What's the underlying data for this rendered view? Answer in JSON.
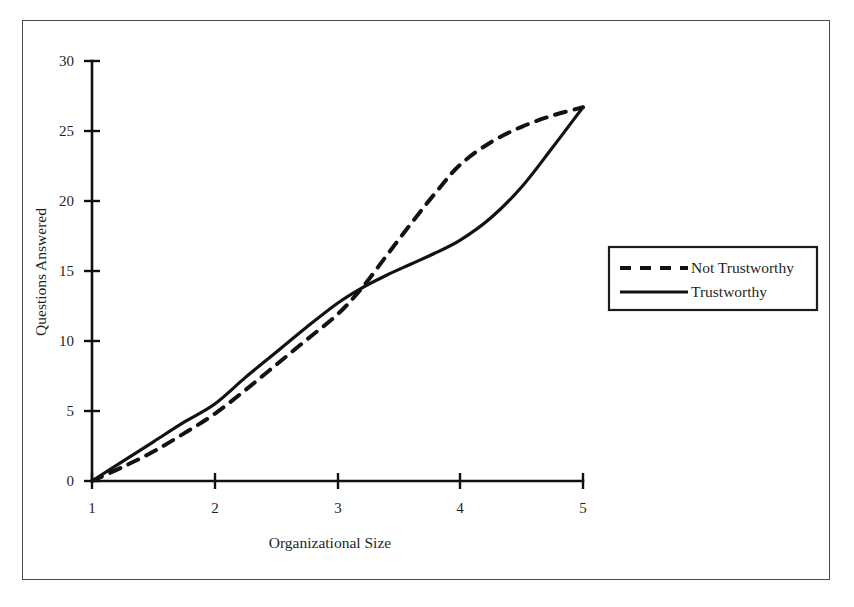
{
  "figure": {
    "frame_visible": true,
    "background_color": "#ffffff",
    "ink_color": "#121212"
  },
  "chart_data": {
    "type": "line",
    "title": "",
    "subtitle": "",
    "xlabel": "Organizational Size",
    "ylabel": "Questions Answered",
    "xlim": [
      1,
      5
    ],
    "ylim": [
      0,
      30
    ],
    "xticks": [
      1,
      2,
      3,
      4,
      5
    ],
    "xtick_labels": [
      "1",
      "2",
      "3",
      "4",
      "5"
    ],
    "yticks": [
      0,
      5,
      10,
      15,
      20,
      25,
      30
    ],
    "ytick_labels": [
      "0",
      "5",
      "10",
      "15",
      "20",
      "25",
      "30"
    ],
    "grid": false,
    "legend_position": "right-outside",
    "annotations": [],
    "series": [
      {
        "name": "Not Trustworthy",
        "style": "dashed",
        "color": "#121212",
        "x": [
          1.0,
          1.25,
          1.5,
          1.75,
          2.0,
          2.25,
          2.5,
          2.75,
          3.0,
          3.2,
          3.4,
          3.6,
          3.8,
          4.0,
          4.25,
          4.5,
          4.75,
          5.0
        ],
        "values": [
          0.0,
          1.0,
          2.1,
          3.4,
          4.8,
          6.5,
          8.3,
          10.1,
          11.9,
          13.8,
          16.1,
          18.4,
          20.6,
          22.6,
          24.2,
          25.3,
          26.1,
          26.7
        ]
      },
      {
        "name": "Trustworthy",
        "style": "solid",
        "color": "#121212",
        "x": [
          1.0,
          1.25,
          1.5,
          1.75,
          2.0,
          2.25,
          2.5,
          2.75,
          3.0,
          3.2,
          3.4,
          3.6,
          3.8,
          4.0,
          4.25,
          4.5,
          4.75,
          5.0
        ],
        "values": [
          0.0,
          1.4,
          2.8,
          4.2,
          5.5,
          7.4,
          9.2,
          11.0,
          12.7,
          13.8,
          14.7,
          15.5,
          16.3,
          17.2,
          18.8,
          21.0,
          23.8,
          26.7
        ]
      }
    ]
  },
  "legend": {
    "entries": [
      {
        "label": "Not Trustworthy",
        "style": "dashed"
      },
      {
        "label": "Trustworthy",
        "style": "solid"
      }
    ]
  }
}
